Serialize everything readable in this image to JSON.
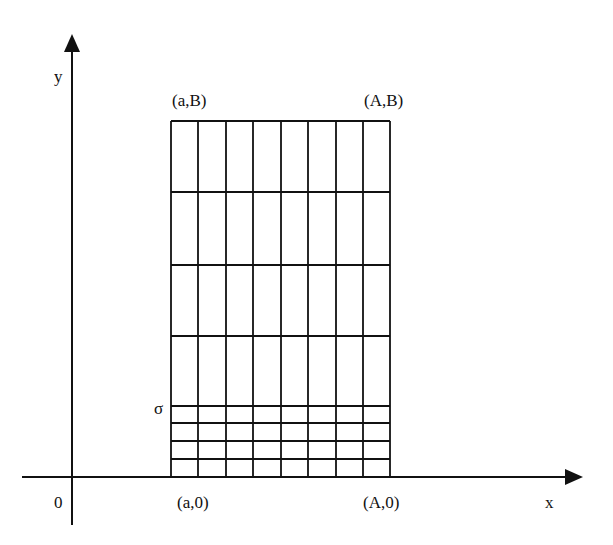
{
  "axes": {
    "x_label": "x",
    "y_label": "y",
    "origin_label": "0"
  },
  "corners": {
    "top_left": "(a,B)",
    "top_right": "(A,B)",
    "bottom_left": "(a,0)",
    "bottom_right": "(A,0)"
  },
  "sigma_label": "σ",
  "grid": {
    "columns": 8,
    "coarse_rows": 4,
    "fine_rows": 4,
    "x_lines": [
      171,
      198,
      226,
      253,
      281,
      308,
      336,
      363,
      390
    ],
    "y_lines": [
      121,
      192,
      265,
      336,
      406,
      423,
      441,
      459,
      477
    ]
  },
  "colors": {
    "line": "#111111",
    "background": "#ffffff"
  }
}
